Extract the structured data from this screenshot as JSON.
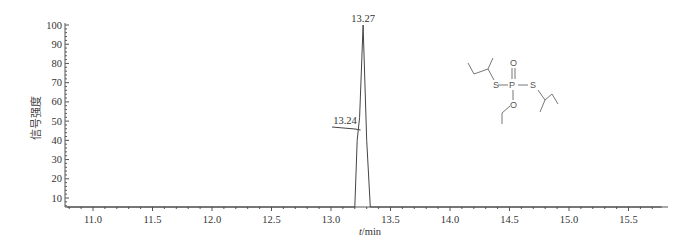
{
  "chart_data": {
    "type": "line",
    "title": "",
    "xlabel": "t/min",
    "ylabel": "信号强度",
    "xlim": [
      10.78,
      15.78
    ],
    "ylim": [
      5,
      100
    ],
    "grid": false,
    "legend": null,
    "x_ticks": [
      11.0,
      11.5,
      12.0,
      12.5,
      13.0,
      13.5,
      14.0,
      14.5,
      15.0,
      15.5
    ],
    "x_tick_labels": [
      "11.0",
      "11.5",
      "12.0",
      "12.5",
      "13.0",
      "13.5",
      "14.0",
      "14.5",
      "15.0",
      "15.5"
    ],
    "y_ticks": [
      10,
      20,
      30,
      40,
      50,
      60,
      70,
      80,
      90,
      100
    ],
    "y_tick_labels": [
      "10",
      "20",
      "30",
      "40",
      "50",
      "60",
      "70",
      "80",
      "90",
      "100"
    ],
    "series": [
      {
        "name": "chromatogram",
        "x": [
          10.78,
          13.2,
          13.22,
          13.24,
          13.27,
          13.3,
          13.33,
          15.78
        ],
        "y": [
          5,
          5,
          40,
          52,
          100,
          40,
          5,
          5
        ]
      }
    ],
    "annotations": [
      {
        "text": "13.27",
        "x": 13.27,
        "y": 100
      },
      {
        "text": "13.24",
        "x": 13.24,
        "y": 52
      }
    ],
    "inset": {
      "type": "chemical-structure",
      "atoms": [
        "S",
        "P",
        "S",
        "O",
        "O"
      ]
    }
  }
}
